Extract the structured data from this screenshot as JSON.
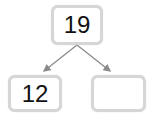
{
  "diagram": {
    "type": "number-bond",
    "whole": {
      "value": "19"
    },
    "parts": [
      {
        "value": "12"
      },
      {
        "value": ""
      }
    ],
    "colors": {
      "box_border": "#d6d6d6",
      "arrow": "#8a8a8a",
      "text": "#111111"
    }
  }
}
